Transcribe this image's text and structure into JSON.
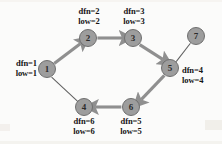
{
  "figure": {
    "type": "directed-graph-diagram",
    "background_color": "#fbfbfa",
    "node_fill_color": "#9d9d9d",
    "node_border_color": "#6f6f6f",
    "tree_edge_color": "#8f8f8f",
    "back_edge_color": "#6a6a6a"
  },
  "nodes": [
    {
      "id": "1",
      "label": "1",
      "x": 47,
      "y": 69,
      "r": 9,
      "annotation": {
        "dfn": "dfn=1",
        "low": "low=1",
        "position": "left"
      }
    },
    {
      "id": "2",
      "label": "2",
      "x": 88,
      "y": 38,
      "r": 9,
      "annotation": {
        "dfn": "dfn=2",
        "low": "low=2",
        "position": "above"
      }
    },
    {
      "id": "3",
      "label": "3",
      "x": 133,
      "y": 38,
      "r": 9,
      "annotation": {
        "dfn": "dfn=3",
        "low": "low=3",
        "position": "above"
      }
    },
    {
      "id": "4",
      "label": "4",
      "x": 84,
      "y": 107,
      "r": 9,
      "annotation": {
        "dfn": "dfn=6",
        "low": "low=6",
        "position": "below"
      }
    },
    {
      "id": "5",
      "label": "5",
      "x": 170,
      "y": 68,
      "r": 9,
      "annotation": {
        "dfn": "dfn=4",
        "low": "low=4",
        "position": "right"
      }
    },
    {
      "id": "6",
      "label": "6",
      "x": 131,
      "y": 107,
      "r": 9,
      "annotation": {
        "dfn": "dfn=5",
        "low": "low=5",
        "position": "below"
      }
    },
    {
      "id": "7",
      "label": "7",
      "x": 196,
      "y": 36,
      "r": 9,
      "annotation": null
    }
  ],
  "edges": [
    {
      "from": "1",
      "to": "2",
      "kind": "tree",
      "directed": true
    },
    {
      "from": "2",
      "to": "3",
      "kind": "tree",
      "directed": true
    },
    {
      "from": "3",
      "to": "5",
      "kind": "tree",
      "directed": true
    },
    {
      "from": "5",
      "to": "6",
      "kind": "tree",
      "directed": true
    },
    {
      "from": "6",
      "to": "4",
      "kind": "tree",
      "directed": true
    },
    {
      "from": "1",
      "to": "4",
      "kind": "back",
      "directed": false
    },
    {
      "from": "5",
      "to": "7",
      "kind": "back",
      "directed": false
    }
  ],
  "node_text": {
    "n1": "1",
    "n2": "2",
    "n3": "3",
    "n4": "4",
    "n5": "5",
    "n6": "6",
    "n7": "7"
  },
  "annotations": {
    "n1_dfn": "dfn=1",
    "n1_low": "low=1",
    "n2_dfn": "dfn=2",
    "n2_low": "low=2",
    "n3_dfn": "dfn=3",
    "n3_low": "low=3",
    "n4_dfn": "dfn=6",
    "n4_low": "low=6",
    "n5_dfn": "dfn=4",
    "n5_low": "low=4",
    "n6_dfn": "dfn=5",
    "n6_low": "low=5"
  }
}
